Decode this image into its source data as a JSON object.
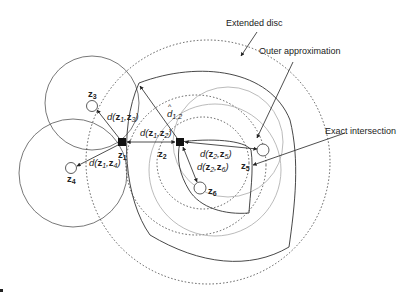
{
  "annotations": {
    "extended_disc": "Extended disc",
    "outer_approximation": "Outer approximation",
    "exact_intersection": "Exact intersection"
  },
  "nodes": {
    "z1": {
      "base": "z",
      "sub": "1"
    },
    "z2": {
      "base": "z",
      "sub": "2"
    },
    "z3": {
      "base": "z",
      "sub": "3"
    },
    "z4": {
      "base": "z",
      "sub": "4"
    },
    "z5": {
      "base": "z",
      "sub": "5"
    },
    "z6": {
      "base": "z",
      "sub": "6"
    }
  },
  "distances": {
    "d13": {
      "fn": "d(",
      "a": "z",
      "as": "1",
      "sep": ",",
      "b": "z",
      "bs": "3",
      "close": ")"
    },
    "d12": {
      "fn": "d(",
      "a": "z",
      "as": "1",
      "sep": ",",
      "b": "z",
      "bs": "2",
      "close": ")"
    },
    "d14": {
      "fn": "d(",
      "a": "z",
      "as": "1",
      "sep": ",",
      "b": "z",
      "bs": "4",
      "close": ")"
    },
    "d25": {
      "fn": "d(",
      "a": "z",
      "as": "2",
      "sep": ",",
      "b": "z",
      "bs": "5",
      "close": ")"
    },
    "d26": {
      "fn": "d(",
      "a": "z",
      "as": "2",
      "sep": ",",
      "b": "z",
      "bs": "6",
      "close": ")"
    },
    "dhat12": {
      "base": "d",
      "sub": "1,2",
      "hat": "^"
    }
  },
  "colors": {
    "stroke": "#333333",
    "light_stroke": "#aaaaaa",
    "text": "#222222"
  }
}
